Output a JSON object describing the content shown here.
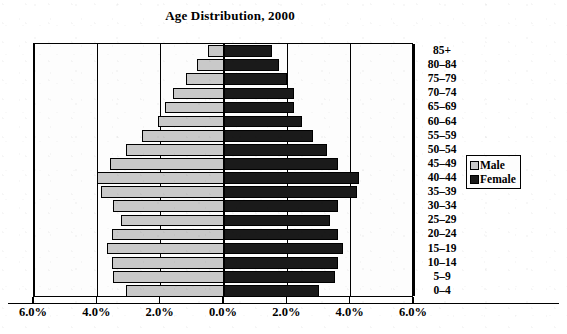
{
  "chart_data": {
    "type": "bar",
    "subtype": "population-pyramid",
    "title": "Age Distribution, 2000",
    "xlabel": "",
    "ylabel": "",
    "xlim": [
      -6.0,
      6.0
    ],
    "grid": true,
    "legend_position": "right",
    "x_tick_values": [
      -6.0,
      -4.0,
      -2.0,
      0.0,
      2.0,
      4.0,
      6.0
    ],
    "x_tick_labels": [
      "6.0%",
      "4.0%",
      "2.0%",
      "0.0%",
      "2.0%",
      "4.0%",
      "6.0%"
    ],
    "categories": [
      "85+",
      "80–84",
      "75–79",
      "70–74",
      "65–69",
      "60–64",
      "55–59",
      "50–54",
      "45–49",
      "40–44",
      "35–39",
      "30–34",
      "25–29",
      "20–24",
      "15–19",
      "10–14",
      "5–9",
      "0–4"
    ],
    "series": [
      {
        "name": "Male",
        "color": "#c9c9c9",
        "values": [
          0.5,
          0.85,
          1.2,
          1.6,
          1.85,
          2.1,
          2.6,
          3.1,
          3.6,
          4.0,
          3.9,
          3.5,
          3.25,
          3.55,
          3.7,
          3.55,
          3.5,
          3.1
        ]
      },
      {
        "name": "Female",
        "color": "#1a1a1a",
        "values": [
          1.5,
          1.75,
          2.0,
          2.2,
          2.2,
          2.45,
          2.8,
          3.25,
          3.6,
          4.25,
          4.2,
          3.6,
          3.35,
          3.6,
          3.75,
          3.6,
          3.5,
          3.0
        ]
      }
    ]
  },
  "legend": {
    "items": [
      {
        "label": "Male",
        "swatch": "male-swatch"
      },
      {
        "label": "Female",
        "swatch": "female-swatch"
      }
    ]
  }
}
